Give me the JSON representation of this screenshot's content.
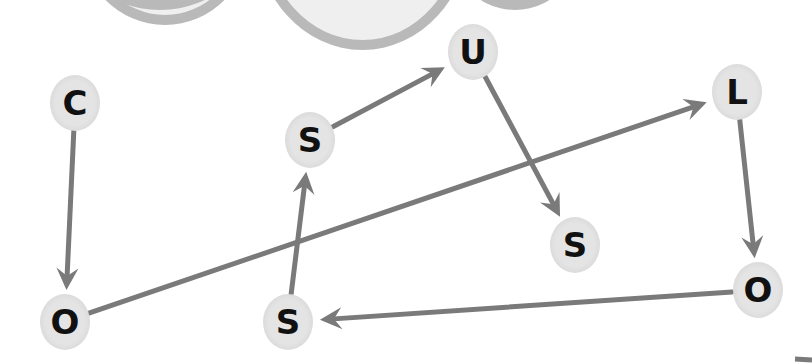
{
  "diagram": {
    "type": "letter-path-puzzle",
    "colors": {
      "arrow": "#7a7a7a",
      "node_fill": "#e2e2e2",
      "letter": "#111111",
      "bubble_border": "#b9b9b9",
      "bubble_fill": "#efefef"
    },
    "nodes": [
      {
        "id": "n0",
        "letter": "C",
        "x": 75,
        "y": 103
      },
      {
        "id": "n1",
        "letter": "O",
        "x": 65,
        "y": 322
      },
      {
        "id": "n2",
        "letter": "S",
        "x": 310,
        "y": 140
      },
      {
        "id": "n3",
        "letter": "U",
        "x": 473,
        "y": 52
      },
      {
        "id": "n4",
        "letter": "L",
        "x": 737,
        "y": 92
      },
      {
        "id": "n5",
        "letter": "S",
        "x": 575,
        "y": 245
      },
      {
        "id": "n6",
        "letter": "O",
        "x": 758,
        "y": 290
      },
      {
        "id": "n7",
        "letter": "S",
        "x": 288,
        "y": 322
      }
    ],
    "edges": [
      {
        "from": "n0",
        "to": "n1"
      },
      {
        "from": "n1",
        "to": "n4"
      },
      {
        "from": "n4",
        "to": "n6"
      },
      {
        "from": "n6",
        "to": "n7"
      },
      {
        "from": "n7",
        "to": "n2"
      },
      {
        "from": "n2",
        "to": "n3"
      },
      {
        "from": "n3",
        "to": "n5"
      }
    ]
  }
}
